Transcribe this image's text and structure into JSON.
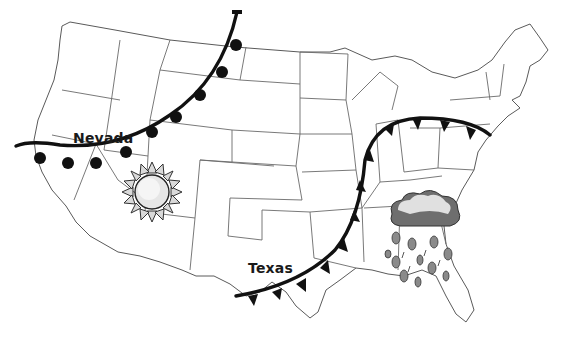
{
  "map": {
    "title": "US weather map",
    "labels": {
      "nevada": "Nevada",
      "texas": "Texas"
    },
    "symbols": [
      {
        "name": "sun-icon",
        "meaning": "sunny",
        "location": "Utah / Arizona region"
      },
      {
        "name": "rain-cloud-icon",
        "meaning": "rain",
        "location": "Southeast (Alabama / Georgia)"
      }
    ],
    "fronts": [
      {
        "name": "warm-front",
        "type": "warm",
        "symbol": "semicircles",
        "path": "Montana to California across Nevada"
      },
      {
        "name": "cold-front",
        "type": "cold",
        "symbol": "triangles",
        "path": "Texas through Missouri to Pennsylvania"
      }
    ],
    "colors": {
      "line": "#111111",
      "state_border": "#5a5a5a",
      "cloud_dark": "#6e6e6e",
      "cloud_light": "#d8d8d8",
      "rain_drop": "#8a8a8a",
      "sun": "#cfcfcf"
    }
  }
}
